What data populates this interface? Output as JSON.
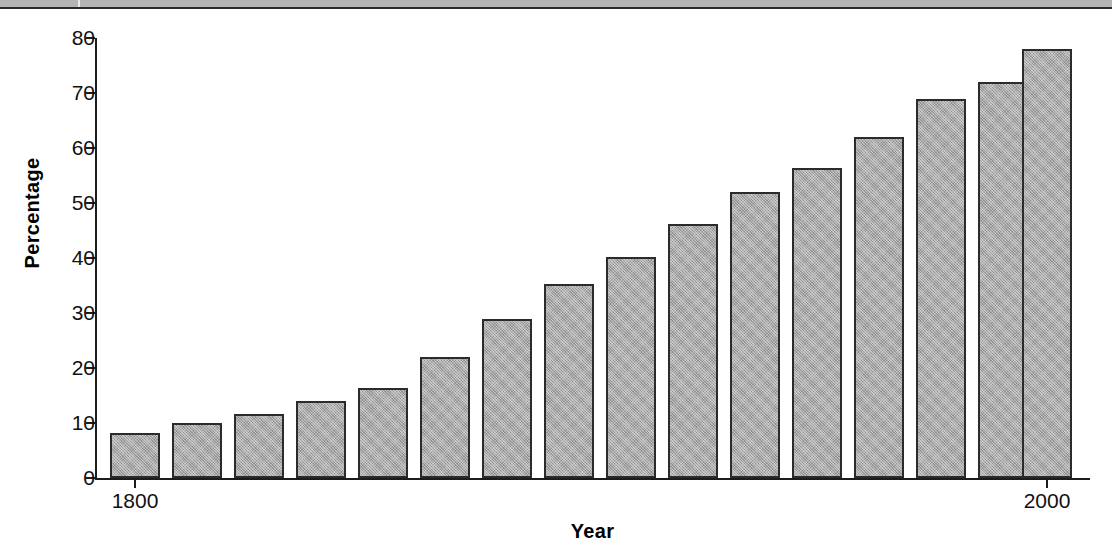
{
  "figure": {
    "scan_band_present": true,
    "bar_fill_color": "#a9a9a9",
    "bar_border_color": "#2b2b2b",
    "axis_color": "#1c1c1c",
    "background_color": "#ffffff"
  },
  "axes": {
    "y_title": "Percentage",
    "x_title": "Year",
    "y_ticks": [
      "0",
      "10",
      "20",
      "30",
      "40",
      "50",
      "60",
      "70",
      "80"
    ],
    "x_ticks": [
      "1800",
      "1850",
      "1900",
      "1950",
      "2000"
    ]
  },
  "chart_data": {
    "type": "bar",
    "title": "",
    "xlabel": "Year",
    "ylabel": "Percentage",
    "xlim": [
      1793,
      2007
    ],
    "ylim": [
      0,
      80
    ],
    "grid": false,
    "legend": null,
    "ytick_values": [
      0,
      10,
      20,
      30,
      40,
      50,
      60,
      70,
      80
    ],
    "xtick_values": [
      1800,
      1850,
      1900,
      1950,
      2000
    ],
    "categories": [
      "1800",
      "1813",
      "1827",
      "1840",
      "1853",
      "1867",
      "1880",
      "1893",
      "1907",
      "1920",
      "1933",
      "1947",
      "1960",
      "1973",
      "1987",
      "2000"
    ],
    "x": [
      1800,
      1813,
      1827,
      1840,
      1853,
      1867,
      1880,
      1893,
      1907,
      1920,
      1933,
      1947,
      1960,
      1973,
      1987,
      2000
    ],
    "values": [
      8.2,
      10.0,
      11.7,
      14.0,
      16.3,
      22.0,
      29.0,
      35.3,
      40.2,
      46.2,
      52.0,
      56.3,
      62.0,
      69.0,
      72.0,
      76.0
    ],
    "bar_count": 16
  },
  "bars": [
    {
      "label": "1800",
      "value": 8.2,
      "x": 110
    },
    {
      "label": "1813",
      "value": 10.0,
      "x": 172
    },
    {
      "label": "1827",
      "value": 11.7,
      "x": 234
    },
    {
      "label": "1840",
      "value": 14.0,
      "x": 296
    },
    {
      "label": "1853",
      "value": 16.3,
      "x": 358
    },
    {
      "label": "1867",
      "value": 22.0,
      "x": 420
    },
    {
      "label": "1880",
      "value": 29.0,
      "x": 482
    },
    {
      "label": "1893",
      "value": 35.3,
      "x": 544
    },
    {
      "label": "1907",
      "value": 40.2,
      "x": 606
    },
    {
      "label": "1920",
      "value": 46.2,
      "x": 668
    },
    {
      "label": "1933",
      "value": 52.0,
      "x": 730
    },
    {
      "label": "1947",
      "value": 56.3,
      "x": 792
    },
    {
      "label": "1960",
      "value": 62.0,
      "x": 854
    },
    {
      "label": "1973",
      "value": 69.0,
      "x": 916
    },
    {
      "label": "1987",
      "value": 72.0,
      "x": 978
    },
    {
      "label": "2000",
      "value": 78.0,
      "x": 1022
    }
  ]
}
